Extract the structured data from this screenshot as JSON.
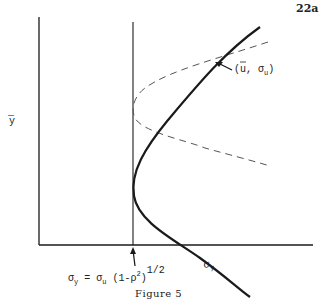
{
  "page_number": "22a",
  "caption": "Figure 5",
  "axes": {
    "y_label": "y",
    "y_label_bar": "—"
  },
  "labels": {
    "point_label_open": "(",
    "point_u": "u",
    "point_sep": ",  σ",
    "point_sub": "u",
    "point_close": ")",
    "curve_label": "σ",
    "curve_label_sub": "y",
    "formula_lhs": "σ",
    "formula_lhs_sub": "y",
    "formula_eq": " = σ",
    "formula_sub_u": "u",
    "formula_paren": " (1-ρ",
    "formula_sq": "2",
    "formula_close": ")",
    "formula_exp": "1/2"
  },
  "colors": {
    "ink": "#1a1a1a",
    "dashed": "#555555",
    "background": "#ffffff"
  }
}
